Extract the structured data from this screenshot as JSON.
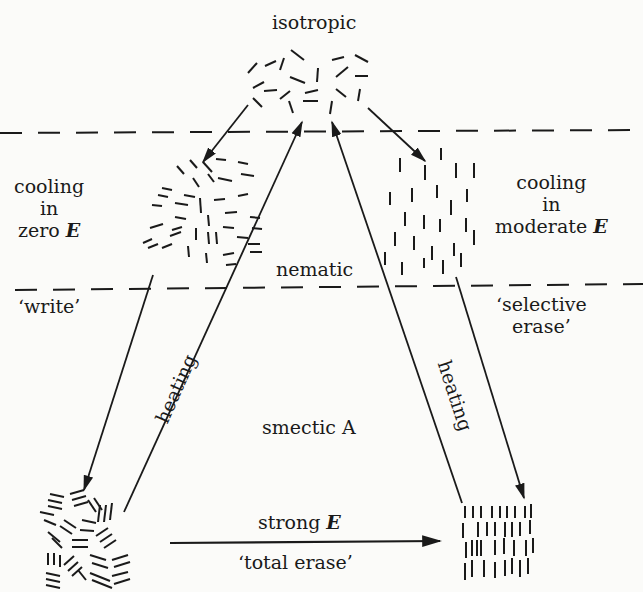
{
  "phases": {
    "isotropic": "isotropic",
    "nematic": "nematic",
    "smectic": "smectic A"
  },
  "left_side": {
    "cooling_line1": "cooling",
    "cooling_line2": "in",
    "cooling_line3": "zero",
    "field_symbol": "E",
    "action": "‘write’"
  },
  "right_side": {
    "cooling_line1": "cooling",
    "cooling_line2": "in",
    "cooling_line3": "moderate",
    "field_symbol": "E",
    "action_line1": "‘selective",
    "action_line2": "erase’"
  },
  "arrows": {
    "left_heating": "heating",
    "right_heating": "heating",
    "bottom_top_label": "strong",
    "bottom_field_symbol": "E",
    "bottom_bottom_label": "‘total erase’"
  },
  "colors": {
    "background": "#fbfbf9",
    "ink": "#1a1a1a"
  }
}
